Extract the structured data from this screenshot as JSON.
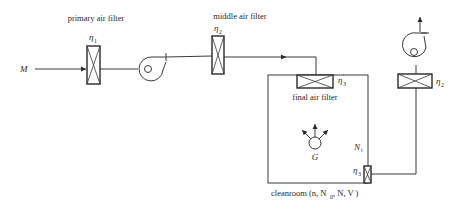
{
  "diagram": {
    "type": "cleanroom air filtration schematic",
    "labels": {
      "inlet": "M",
      "primary_filter": "primary air filter",
      "middle_filter": "middle air filter",
      "final_filter": "final air filter",
      "source": "G",
      "indoor_conc": "N",
      "indoor_conc_sub": "t",
      "room": "cleanroom (n, N",
      "room_sub": "0",
      "room_tail": " , N, V )"
    },
    "efficiencies": {
      "primary": {
        "symbol": "η",
        "sub": "1"
      },
      "middle": {
        "symbol": "η",
        "sub": "2"
      },
      "final": {
        "symbol": "η",
        "sub": "3",
        "sup": "'"
      },
      "return": {
        "symbol": "η",
        "sub": "3"
      },
      "exhaust": {
        "symbol": "η",
        "sub": "2"
      }
    },
    "colors": {
      "line": "#3a3a3a",
      "text": "#2a2a2a",
      "background": "#ffffff"
    }
  }
}
